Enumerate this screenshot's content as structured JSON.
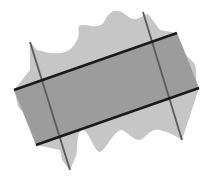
{
  "figure": {
    "colors": {
      "background": "#ffffff",
      "region_fill": "#c6c6c6",
      "band_fill": "#9c9c9c",
      "band_edge": "#1a1a1a",
      "cross_line": "#5a5a5a"
    },
    "band_lines": [
      {
        "x1": 14,
        "y1": 90,
        "x2": 177,
        "y2": 33
      },
      {
        "x1": 36,
        "y1": 145,
        "x2": 199,
        "y2": 88
      }
    ],
    "cross_lines": [
      {
        "x1": 30,
        "y1": 42,
        "x2": 70,
        "y2": 170
      },
      {
        "x1": 143,
        "y1": 12,
        "x2": 182,
        "y2": 140
      }
    ]
  }
}
